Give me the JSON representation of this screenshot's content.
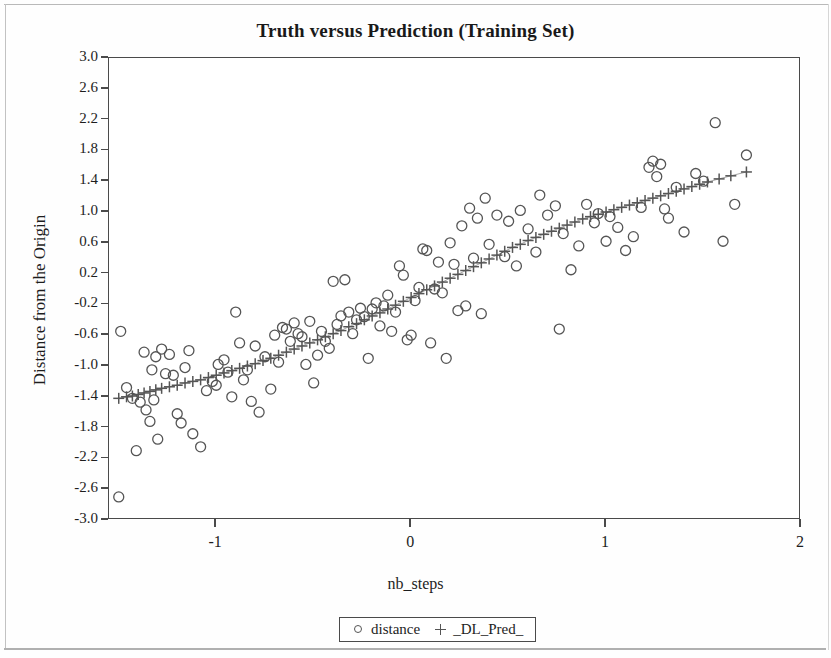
{
  "page": {
    "title": "Truth versus Prediction (Training Set)"
  },
  "chart_data": {
    "type": "scatter",
    "title": "Truth versus Prediction (Training Set)",
    "xlabel": "nb_steps",
    "ylabel": "Distance from the Origin",
    "xlim": [
      -1.55,
      2.0
    ],
    "ylim": [
      -3.0,
      3.0
    ],
    "xticks": [
      -1,
      0,
      1,
      2
    ],
    "xtick_labels": [
      "-1",
      "0",
      "1",
      "2"
    ],
    "yticks": [
      3.0,
      2.6,
      2.2,
      1.8,
      1.4,
      1.0,
      0.6,
      0.2,
      -0.2,
      -0.6,
      -1.0,
      -1.4,
      -1.8,
      -2.2,
      -2.6,
      -3.0
    ],
    "ytick_labels": [
      "3.0",
      "2.6",
      "2.2",
      "1.8",
      "1.4",
      "1.0",
      "0.6",
      "0.2",
      "-0.2",
      "-0.6",
      "-1.0",
      "-1.4",
      "-1.8",
      "-2.2",
      "-2.6",
      "-3.0"
    ],
    "grid": false,
    "legend_position": "bottom-center",
    "marker_color": "#555555",
    "series": [
      {
        "name": "distance",
        "marker": "circle",
        "points": [
          [
            -1.5,
            -2.7
          ],
          [
            -1.49,
            -0.55
          ],
          [
            -1.46,
            -1.28
          ],
          [
            -1.43,
            -1.42
          ],
          [
            -1.41,
            -2.1
          ],
          [
            -1.39,
            -1.47
          ],
          [
            -1.37,
            -0.82
          ],
          [
            -1.36,
            -1.57
          ],
          [
            -1.34,
            -1.72
          ],
          [
            -1.33,
            -1.05
          ],
          [
            -1.32,
            -1.44
          ],
          [
            -1.31,
            -0.88
          ],
          [
            -1.3,
            -1.95
          ],
          [
            -1.28,
            -0.78
          ],
          [
            -1.26,
            -1.1
          ],
          [
            -1.24,
            -0.85
          ],
          [
            -1.22,
            -1.12
          ],
          [
            -1.2,
            -1.62
          ],
          [
            -1.18,
            -1.74
          ],
          [
            -1.16,
            -1.02
          ],
          [
            -1.14,
            -0.8
          ],
          [
            -1.12,
            -1.88
          ],
          [
            -1.08,
            -2.05
          ],
          [
            -1.05,
            -1.32
          ],
          [
            -1.02,
            -1.2
          ],
          [
            -0.99,
            -0.98
          ],
          [
            -1.0,
            -1.25
          ],
          [
            -0.96,
            -0.92
          ],
          [
            -0.94,
            -1.08
          ],
          [
            -0.92,
            -1.4
          ],
          [
            -0.9,
            -0.3
          ],
          [
            -0.88,
            -0.7
          ],
          [
            -0.86,
            -1.18
          ],
          [
            -0.84,
            -1.05
          ],
          [
            -0.82,
            -1.46
          ],
          [
            -0.8,
            -0.74
          ],
          [
            -0.78,
            -1.6
          ],
          [
            -0.75,
            -0.88
          ],
          [
            -0.72,
            -1.3
          ],
          [
            -0.7,
            -0.6
          ],
          [
            -0.68,
            -0.95
          ],
          [
            -0.66,
            -0.5
          ],
          [
            -0.64,
            -0.52
          ],
          [
            -0.62,
            -0.68
          ],
          [
            -0.6,
            -0.44
          ],
          [
            -0.58,
            -0.58
          ],
          [
            -0.56,
            -0.62
          ],
          [
            -0.54,
            -0.98
          ],
          [
            -0.52,
            -0.42
          ],
          [
            -0.5,
            -1.22
          ],
          [
            -0.48,
            -0.86
          ],
          [
            -0.46,
            -0.55
          ],
          [
            -0.44,
            -0.68
          ],
          [
            -0.42,
            -0.77
          ],
          [
            -0.4,
            0.1
          ],
          [
            -0.38,
            -0.46
          ],
          [
            -0.36,
            -0.35
          ],
          [
            -0.34,
            0.12
          ],
          [
            -0.32,
            -0.3
          ],
          [
            -0.3,
            -0.58
          ],
          [
            -0.28,
            -0.4
          ],
          [
            -0.26,
            -0.25
          ],
          [
            -0.24,
            -0.36
          ],
          [
            -0.22,
            -0.9
          ],
          [
            -0.2,
            -0.26
          ],
          [
            -0.18,
            -0.18
          ],
          [
            -0.16,
            -0.48
          ],
          [
            -0.14,
            -0.22
          ],
          [
            -0.12,
            -0.08
          ],
          [
            -0.1,
            -0.55
          ],
          [
            -0.08,
            -0.3
          ],
          [
            -0.06,
            0.3
          ],
          [
            -0.04,
            0.18
          ],
          [
            -0.02,
            -0.66
          ],
          [
            0.0,
            -0.6
          ],
          [
            0.02,
            -0.15
          ],
          [
            0.04,
            0.02
          ],
          [
            0.06,
            0.52
          ],
          [
            0.08,
            0.5
          ],
          [
            0.1,
            -0.7
          ],
          [
            0.12,
            0.0
          ],
          [
            0.14,
            0.35
          ],
          [
            0.16,
            -0.05
          ],
          [
            0.18,
            -0.9
          ],
          [
            0.2,
            0.6
          ],
          [
            0.22,
            0.32
          ],
          [
            0.24,
            -0.28
          ],
          [
            0.26,
            0.82
          ],
          [
            0.28,
            -0.22
          ],
          [
            0.3,
            1.05
          ],
          [
            0.32,
            0.4
          ],
          [
            0.34,
            0.92
          ],
          [
            0.36,
            -0.32
          ],
          [
            0.38,
            1.18
          ],
          [
            0.4,
            0.58
          ],
          [
            0.44,
            0.96
          ],
          [
            0.48,
            0.42
          ],
          [
            0.5,
            0.88
          ],
          [
            0.54,
            0.3
          ],
          [
            0.56,
            1.02
          ],
          [
            0.6,
            0.78
          ],
          [
            0.64,
            0.48
          ],
          [
            0.66,
            1.22
          ],
          [
            0.7,
            0.96
          ],
          [
            0.74,
            1.08
          ],
          [
            0.76,
            -0.52
          ],
          [
            0.78,
            0.72
          ],
          [
            0.82,
            0.25
          ],
          [
            0.86,
            0.56
          ],
          [
            0.9,
            1.1
          ],
          [
            0.94,
            0.86
          ],
          [
            0.96,
            0.98
          ],
          [
            1.0,
            0.62
          ],
          [
            1.02,
            0.94
          ],
          [
            1.06,
            0.8
          ],
          [
            1.1,
            0.5
          ],
          [
            1.14,
            0.68
          ],
          [
            1.18,
            1.06
          ],
          [
            1.22,
            1.58
          ],
          [
            1.24,
            1.66
          ],
          [
            1.26,
            1.46
          ],
          [
            1.28,
            1.62
          ],
          [
            1.3,
            1.04
          ],
          [
            1.32,
            0.92
          ],
          [
            1.36,
            1.32
          ],
          [
            1.4,
            0.74
          ],
          [
            1.46,
            1.5
          ],
          [
            1.5,
            1.4
          ],
          [
            1.56,
            2.16
          ],
          [
            1.6,
            0.62
          ],
          [
            1.66,
            1.1
          ],
          [
            1.72,
            1.74
          ]
        ]
      },
      {
        "name": "_DL_Pred_",
        "marker": "plus",
        "points": [
          [
            -1.5,
            -1.42
          ],
          [
            -1.46,
            -1.4
          ],
          [
            -1.43,
            -1.39
          ],
          [
            -1.4,
            -1.37
          ],
          [
            -1.37,
            -1.35
          ],
          [
            -1.34,
            -1.33
          ],
          [
            -1.31,
            -1.31
          ],
          [
            -1.28,
            -1.29
          ],
          [
            -1.24,
            -1.27
          ],
          [
            -1.2,
            -1.25
          ],
          [
            -1.16,
            -1.22
          ],
          [
            -1.12,
            -1.2
          ],
          [
            -1.08,
            -1.18
          ],
          [
            -1.04,
            -1.15
          ],
          [
            -1.0,
            -1.12
          ],
          [
            -0.96,
            -1.09
          ],
          [
            -0.92,
            -1.06
          ],
          [
            -0.88,
            -1.03
          ],
          [
            -0.84,
            -1.0
          ],
          [
            -0.8,
            -0.97
          ],
          [
            -0.76,
            -0.93
          ],
          [
            -0.72,
            -0.9
          ],
          [
            -0.68,
            -0.86
          ],
          [
            -0.64,
            -0.82
          ],
          [
            -0.6,
            -0.78
          ],
          [
            -0.56,
            -0.74
          ],
          [
            -0.52,
            -0.7
          ],
          [
            -0.48,
            -0.66
          ],
          [
            -0.44,
            -0.62
          ],
          [
            -0.4,
            -0.58
          ],
          [
            -0.36,
            -0.54
          ],
          [
            -0.32,
            -0.49
          ],
          [
            -0.28,
            -0.45
          ],
          [
            -0.24,
            -0.4
          ],
          [
            -0.2,
            -0.35
          ],
          [
            -0.16,
            -0.31
          ],
          [
            -0.12,
            -0.26
          ],
          [
            -0.08,
            -0.21
          ],
          [
            -0.04,
            -0.16
          ],
          [
            0.0,
            -0.11
          ],
          [
            0.04,
            -0.06
          ],
          [
            0.08,
            -0.01
          ],
          [
            0.12,
            0.04
          ],
          [
            0.16,
            0.09
          ],
          [
            0.2,
            0.14
          ],
          [
            0.24,
            0.19
          ],
          [
            0.28,
            0.24
          ],
          [
            0.32,
            0.29
          ],
          [
            0.36,
            0.34
          ],
          [
            0.4,
            0.39
          ],
          [
            0.44,
            0.44
          ],
          [
            0.48,
            0.49
          ],
          [
            0.52,
            0.54
          ],
          [
            0.56,
            0.58
          ],
          [
            0.6,
            0.63
          ],
          [
            0.64,
            0.67
          ],
          [
            0.68,
            0.71
          ],
          [
            0.72,
            0.75
          ],
          [
            0.76,
            0.79
          ],
          [
            0.8,
            0.83
          ],
          [
            0.84,
            0.87
          ],
          [
            0.88,
            0.91
          ],
          [
            0.92,
            0.94
          ],
          [
            0.96,
            0.97
          ],
          [
            1.0,
            1.0
          ],
          [
            1.04,
            1.03
          ],
          [
            1.08,
            1.06
          ],
          [
            1.12,
            1.09
          ],
          [
            1.16,
            1.12
          ],
          [
            1.2,
            1.15
          ],
          [
            1.24,
            1.18
          ],
          [
            1.28,
            1.21
          ],
          [
            1.32,
            1.24
          ],
          [
            1.36,
            1.27
          ],
          [
            1.4,
            1.3
          ],
          [
            1.44,
            1.33
          ],
          [
            1.48,
            1.36
          ],
          [
            1.52,
            1.39
          ],
          [
            1.58,
            1.43
          ],
          [
            1.64,
            1.47
          ],
          [
            1.72,
            1.52
          ]
        ]
      }
    ]
  },
  "legend": {
    "entries": [
      {
        "marker": "circle",
        "label": "distance"
      },
      {
        "marker": "plus",
        "label": "_DL_Pred_"
      }
    ]
  }
}
